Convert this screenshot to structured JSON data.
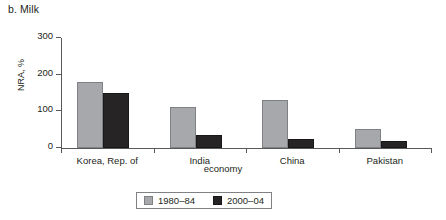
{
  "chart_data": {
    "type": "bar",
    "title": "b. Milk",
    "xlabel": "economy",
    "ylabel": "NRA, %",
    "categories": [
      "Korea, Rep. of",
      "India",
      "China",
      "Pakistan"
    ],
    "series": [
      {
        "name": "1980–84",
        "color": "#a6a8ab",
        "values": [
          180,
          113,
          130,
          52
        ]
      },
      {
        "name": "2000–04",
        "color": "#272425",
        "values": [
          150,
          35,
          25,
          20
        ]
      }
    ],
    "ylim": [
      0,
      300
    ],
    "yticks": [
      0,
      100,
      200,
      300
    ],
    "ytick_labels": [
      "0",
      "100",
      "200",
      "300"
    ],
    "grid": false,
    "legend_position": "bottom-center"
  }
}
